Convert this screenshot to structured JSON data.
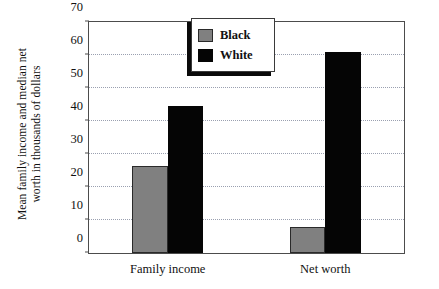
{
  "chart_data": {
    "type": "bar",
    "title": "",
    "xlabel": "",
    "ylabel_lines": [
      "Mean family income and median net",
      "worth in thousands of dollars"
    ],
    "ylabel": "Mean family income and median net worth in thousands of dollars",
    "categories": [
      "Family income",
      "Net worth"
    ],
    "series": [
      {
        "name": "Black",
        "color": "#808080",
        "values": [
          26.5,
          8
        ]
      },
      {
        "name": "White",
        "color": "#050505",
        "values": [
          44.5,
          61
        ]
      }
    ],
    "ylim": [
      0,
      70
    ],
    "yticks": [
      0,
      10,
      20,
      30,
      40,
      50,
      60,
      70
    ],
    "ytick_labels": [
      "0",
      "10",
      "20",
      "30",
      "40",
      "50",
      "60",
      "70"
    ],
    "grid": true,
    "grid_style": "dotted",
    "legend_position": "top-center",
    "legend_entries": [
      "Black",
      "White"
    ]
  }
}
